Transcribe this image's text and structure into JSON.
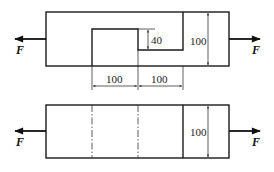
{
  "diagram": {
    "type": "mechanics-shear-joint",
    "top_figure": {
      "force_left": "F",
      "force_right": "F",
      "dim_step_height": "40",
      "dim_total_height": "100",
      "dim_left_span": "100",
      "dim_right_span": "100"
    },
    "bottom_figure": {
      "force_left": "F",
      "force_right": "F",
      "dim_total_height": "100"
    },
    "colors": {
      "line": "#1a1a1a",
      "background": "#ffffff"
    }
  }
}
